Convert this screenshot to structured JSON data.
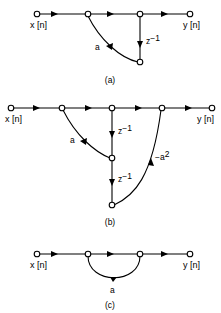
{
  "figure": {
    "background_color": "#ffffff",
    "line_color": "#000000",
    "width": 221,
    "height": 313
  },
  "panels": [
    {
      "id": "a",
      "caption": "(a)",
      "input_label": "x [n]",
      "output_label": "y [n]",
      "branch_labels": [
        "a",
        "z"
      ],
      "gain_label": "a",
      "delay_label": "z",
      "delay_exponent": "−1",
      "node_count": 5,
      "description": "feedback path from delay output through gain a back to second node"
    },
    {
      "id": "b",
      "caption": "(b)",
      "input_label": "x [n]",
      "output_label": "y [n]",
      "gain_label": "a",
      "gain2_label": "−a",
      "gain2_exponent": "2",
      "delay_label": "z",
      "delay_exponent": "−1",
      "delay2_label": "z",
      "delay2_exponent": "−1",
      "node_count": 7,
      "description": "two cascaded delays with feedback gains a and minus a squared"
    },
    {
      "id": "c",
      "caption": "(c)",
      "input_label": "x [n]",
      "output_label": "y [n]",
      "gain_label": "a",
      "node_count": 4,
      "description": "single forward branch with gain a arc from node two to node three"
    }
  ]
}
